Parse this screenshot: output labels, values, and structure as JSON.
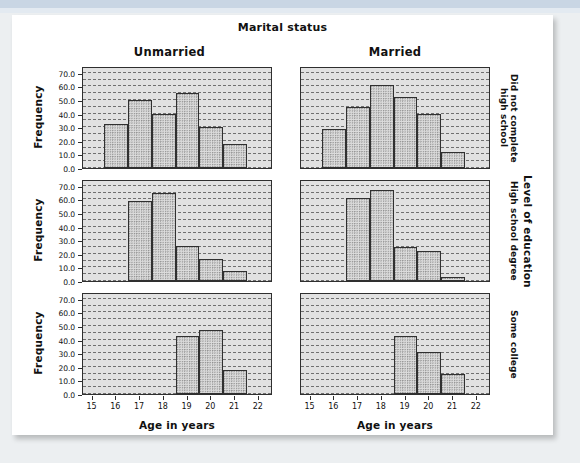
{
  "chart_data": {
    "type": "bar",
    "title": "Marital status",
    "xlabel": "Age in years",
    "ylabel": "Frequency",
    "outer_right_label": "Level of education",
    "ylim": [
      0,
      75
    ],
    "yticks": [
      "0.0",
      "10.0",
      "20.0",
      "30.0",
      "40.0",
      "50.0",
      "60.0",
      "70.0"
    ],
    "ytick_values": [
      0,
      10,
      20,
      30,
      40,
      50,
      60,
      70
    ],
    "xticks": [
      "15",
      "16",
      "17",
      "18",
      "19",
      "20",
      "21",
      "22"
    ],
    "xtick_values": [
      15,
      16,
      17,
      18,
      19,
      20,
      21,
      22
    ],
    "xlim": [
      14.6,
      22.6
    ],
    "grid": "dashed-horizontal",
    "columns": [
      "Unmarried",
      "Married"
    ],
    "rows": [
      "Did not complete high school",
      "High school degree",
      "Some college"
    ],
    "panels": [
      {
        "row": "Did not complete high school",
        "column": "Unmarried",
        "bin_starts": [
          15.5,
          16.5,
          17.5,
          18.5,
          19.5,
          20.5
        ],
        "bin_width": 1,
        "values": [
          32,
          50,
          40,
          55,
          30,
          18
        ]
      },
      {
        "row": "Did not complete high school",
        "column": "Married",
        "bin_starts": [
          15.5,
          16.5,
          17.5,
          18.5,
          19.5,
          20.5
        ],
        "bin_width": 1,
        "values": [
          29,
          45,
          61,
          52,
          40,
          12
        ]
      },
      {
        "row": "High school degree",
        "column": "Unmarried",
        "bin_starts": [
          16.5,
          17.5,
          18.5,
          19.5,
          20.5
        ],
        "bin_width": 1,
        "values": [
          59,
          65,
          26,
          16,
          7
        ]
      },
      {
        "row": "High school degree",
        "column": "Married",
        "bin_starts": [
          16.5,
          17.5,
          18.5,
          19.5,
          20.5
        ],
        "bin_width": 1,
        "values": [
          61,
          67,
          25,
          22,
          3
        ]
      },
      {
        "row": "Some college",
        "column": "Unmarried",
        "bin_starts": [
          18.5,
          19.5,
          20.5
        ],
        "bin_width": 1,
        "values": [
          43,
          47,
          18
        ]
      },
      {
        "row": "Some college",
        "column": "Married",
        "bin_starts": [
          18.5,
          19.5,
          20.5
        ],
        "bin_width": 1,
        "values": [
          43,
          31,
          15
        ]
      }
    ]
  },
  "colors": {
    "panel_background": "#e1e1e1",
    "bar_fill": "#dcdcdc",
    "bar_border": "#303030",
    "gridline": "#6f6f6f",
    "page_background": "#eceff1",
    "card_background": "#ffffff",
    "top_strip": "#c9d6e4"
  }
}
